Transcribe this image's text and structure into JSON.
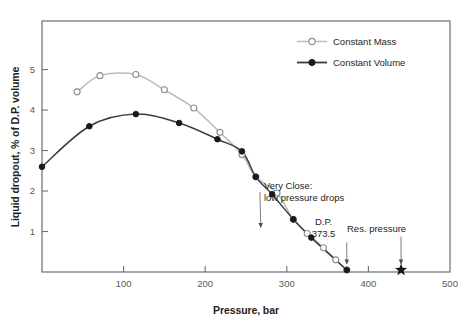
{
  "chart_data": {
    "type": "line",
    "title": "",
    "xlabel": "Pressure, bar",
    "ylabel": "Liquid dropout, % of D.P. volume",
    "xlim": [
      0,
      500
    ],
    "ylim": [
      0,
      6.2
    ],
    "xticks": [
      0,
      100,
      200,
      300,
      400,
      500
    ],
    "xticklabels": [
      "",
      "100",
      "200",
      "300",
      "400",
      "500"
    ],
    "yticks": [
      1,
      2,
      3,
      4,
      5
    ],
    "yticklabels": [
      "1",
      "2",
      "3",
      "4",
      "5"
    ],
    "grid": false,
    "legend_position": "top-right",
    "series": [
      {
        "name": "Constant Mass",
        "marker": "open-circle",
        "color": "#b9bbbd",
        "x": [
          43,
          71,
          115,
          150,
          186,
          218,
          245,
          262,
          288,
          308,
          325,
          345,
          360,
          373.5
        ],
        "y": [
          4.45,
          4.85,
          4.88,
          4.5,
          4.05,
          3.45,
          2.9,
          2.35,
          1.95,
          1.3,
          0.95,
          0.6,
          0.3,
          0.05
        ]
      },
      {
        "name": "Constant Volume",
        "marker": "filled-circle",
        "color": "#3b3b3d",
        "x": [
          0,
          58,
          115,
          168,
          215,
          245,
          262,
          282,
          308,
          330,
          373.5
        ],
        "y": [
          2.6,
          3.6,
          3.9,
          3.68,
          3.28,
          2.98,
          2.35,
          1.92,
          1.3,
          0.85,
          0.05
        ]
      }
    ],
    "annotations": [
      {
        "id": "very-close",
        "text_lines": [
          "Very Close:",
          "low pressure drops"
        ],
        "text_x": 272,
        "text_y": 2.05,
        "target_x": 262,
        "target_y": 1.0
      },
      {
        "id": "dew-point",
        "text_lines": [
          "D.P.",
          "373.5"
        ],
        "text_x": 345,
        "text_y": 1.15,
        "target_x": 373.5,
        "target_y": 0.05
      },
      {
        "id": "res-pressure",
        "text_lines": [
          "Res. pressure"
        ],
        "text_x": 410,
        "text_y": 1.0,
        "target_x": 440,
        "target_y": 0.05
      }
    ],
    "markers": [
      {
        "id": "reservoir-pressure-star",
        "shape": "star",
        "x": 440,
        "y": 0.05
      }
    ]
  },
  "legend": {
    "items": [
      {
        "label": "Constant Mass",
        "marker": "open-circle",
        "color": "#b9bbbd"
      },
      {
        "label": "Constant Volume",
        "marker": "filled-circle",
        "color": "#3b3b3d"
      }
    ]
  },
  "colors": {
    "constant_mass": "#b9bbbd",
    "constant_volume": "#3b3b3d",
    "frame": "#6d6e71",
    "text": "#231f20",
    "tick_text": "#58595b",
    "background": "#ffffff"
  }
}
